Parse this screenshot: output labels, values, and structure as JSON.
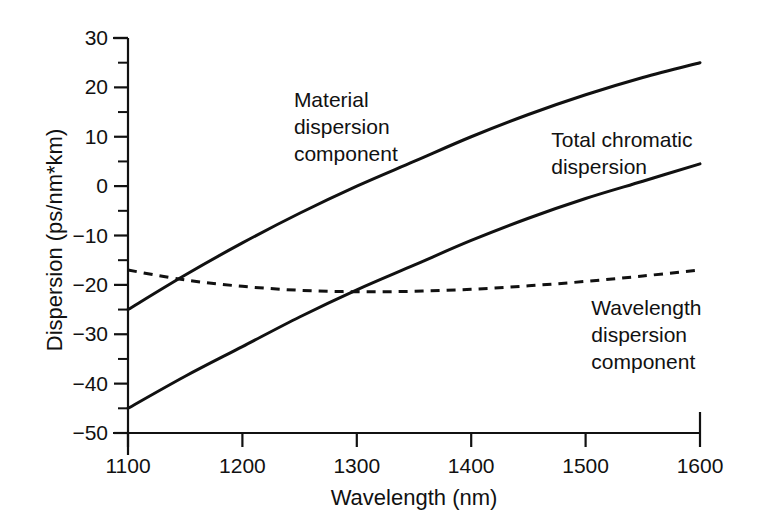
{
  "chart_data": {
    "type": "line",
    "title": "",
    "xlabel": "Wavelength (nm)",
    "ylabel": "Dispersion (ps/nm*km)",
    "xlim": [
      1100,
      1600
    ],
    "ylim": [
      -50,
      30
    ],
    "xticks": [
      "1100",
      "1200",
      "1300",
      "1400",
      "1500",
      "1600"
    ],
    "xtick_values": [
      1100,
      1200,
      1300,
      1400,
      1500,
      1600
    ],
    "yticks": [
      "30",
      "20",
      "10",
      "0",
      "−10",
      "−20",
      "−30",
      "−40",
      "−50"
    ],
    "ytick_values": [
      30,
      20,
      10,
      0,
      -10,
      -20,
      -30,
      -40,
      -50
    ],
    "minor_tick_step": 5,
    "grid": false,
    "legend": "inline-annotations",
    "series": [
      {
        "name": "Material dispersion component",
        "style": "solid",
        "x": [
          1100,
          1150,
          1200,
          1250,
          1300,
          1350,
          1400,
          1450,
          1500,
          1550,
          1600
        ],
        "values": [
          -25.0,
          -18.0,
          -11.5,
          -5.5,
          0.0,
          5.0,
          10.0,
          14.5,
          18.5,
          22.0,
          25.0
        ]
      },
      {
        "name": "Total chromatic dispersion",
        "style": "solid",
        "x": [
          1100,
          1150,
          1200,
          1250,
          1300,
          1350,
          1400,
          1450,
          1500,
          1550,
          1600
        ],
        "values": [
          -45.0,
          -38.5,
          -32.5,
          -26.5,
          -21.0,
          -16.0,
          -11.0,
          -6.5,
          -2.5,
          1.0,
          4.5
        ]
      },
      {
        "name": "Wavelength dispersion component",
        "style": "dashed",
        "x": [
          1100,
          1150,
          1200,
          1250,
          1300,
          1350,
          1400,
          1450,
          1500,
          1550,
          1600
        ],
        "values": [
          -17.0,
          -19.0,
          -20.3,
          -21.1,
          -21.4,
          -21.3,
          -20.9,
          -20.2,
          -19.3,
          -18.2,
          -17.0
        ]
      }
    ],
    "annotations": [
      {
        "name": "material-dispersion-label",
        "lines": [
          "Material",
          "dispersion",
          "component"
        ],
        "x": 1245,
        "y": 16
      },
      {
        "name": "total-chromatic-label",
        "lines": [
          "Total chromatic",
          "dispersion"
        ],
        "x": 1470,
        "y": 8
      },
      {
        "name": "wavelength-dispersion-label",
        "lines": [
          "Wavelength",
          "dispersion",
          "component"
        ],
        "x": 1505,
        "y": -26
      }
    ],
    "colors": {
      "axis": "#111111",
      "curve": "#111111",
      "background": "#ffffff"
    }
  }
}
